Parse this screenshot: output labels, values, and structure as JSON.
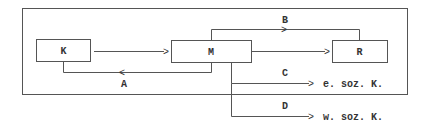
{
  "diagram": {
    "nodes": {
      "k": {
        "label": "K"
      },
      "m": {
        "label": "M"
      },
      "r": {
        "label": "R"
      }
    },
    "edges": {
      "a": {
        "label": "A",
        "from": "M",
        "to": "K"
      },
      "b": {
        "label": "B",
        "from": "M",
        "to": "R"
      },
      "c": {
        "label": "C",
        "from": "M",
        "to": "e. soz. K."
      },
      "d": {
        "label": "D",
        "from": "M",
        "to": "w. soz. K."
      },
      "km": {
        "from": "K",
        "to": "M"
      },
      "mr": {
        "from": "M",
        "to": "R"
      }
    },
    "targets": {
      "c": "e. soz. K.",
      "d": "w. soz. K."
    },
    "arrowhead": ">",
    "arrowhead_left": "<"
  }
}
